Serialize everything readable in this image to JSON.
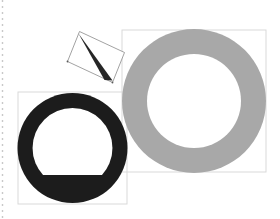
{
  "canvas": {
    "width": 280,
    "height": 219,
    "background": "#ffffff",
    "title": "geometric-shape-composition"
  },
  "palette": {
    "background": "#ffffff",
    "gray_ring": "#a8a8a8",
    "dark_ring": "#1c1c1c",
    "hint_box_stroke": "#d9d9d9",
    "dotted_ruler": "#c9c9c9",
    "inner_highlight": "#d2d2d2",
    "outline_stroke": "#8a8a8a",
    "cone_fill": "#262626"
  },
  "ruler": {
    "name": "dotted-guide-line",
    "x": 2.5,
    "y_start": 0,
    "y_end": 219,
    "dash": "2 4",
    "width": 1.4,
    "color": "#c9c9c9"
  },
  "shapes": [
    {
      "id": "gray-annulus",
      "label": "Large gray ring",
      "type": "annulus",
      "cx": 194,
      "cy": 101,
      "outer_r": 72,
      "inner_r": 47,
      "fill": "#a8a8a8"
    },
    {
      "id": "dark-annulus",
      "label": "Dark ring with flat-bottom hole",
      "type": "annulus-truncated",
      "cx": 72.5,
      "cy": 148,
      "outer_r": 55,
      "inner_r": 40,
      "flat_bottom_y": 175,
      "fill": "#1c1c1c"
    },
    {
      "id": "cone-triangle",
      "label": "Dark narrow cone",
      "type": "triangle",
      "fill": "#262626",
      "points": "78.5,33.5 112.5,80.5 104.5,80.0"
    }
  ],
  "bounding_boxes": [
    {
      "id": "gray-ring-box",
      "label": "Bounding box of gray ring",
      "x": 122,
      "y": 30,
      "width": 144,
      "height": 142,
      "stroke": "#d9d9d9"
    },
    {
      "id": "dark-ring-box",
      "label": "Bounding box of dark ring",
      "x": 18,
      "y": 92,
      "width": 109,
      "height": 112,
      "stroke": "#d9d9d9"
    }
  ],
  "rotated_frame": {
    "id": "rotated-rectangle",
    "label": "Rotated rectangle outline",
    "points": "79.5,31.5 124.5,52.5 112.5,82.5 67.5,61.5",
    "stroke": "#8a8a8a",
    "stroke_width": 0.8,
    "corner_marks": [
      {
        "x": 67.5,
        "y": 61.5
      },
      {
        "x": 112.5,
        "y": 82.5
      }
    ]
  },
  "highlight_arc": {
    "id": "inner-arc-highlight",
    "label": "Pale arc inside dark ring",
    "color": "#d2d2d2",
    "cx": 72.5,
    "cy": 148,
    "r": 43,
    "stroke_width": 6
  }
}
